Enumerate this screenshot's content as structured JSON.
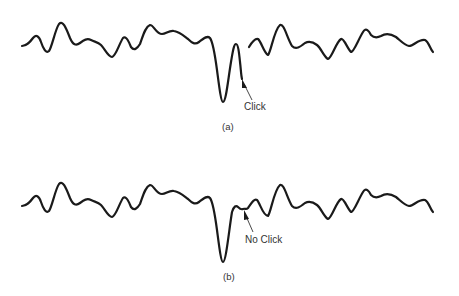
{
  "figure": {
    "panels": [
      {
        "id": "a",
        "caption": "(a)",
        "annotation": "Click",
        "description": "Waveform with a deep negative spike followed by a sharp rebound and a discontinuity (gap) in the trace"
      },
      {
        "id": "b",
        "caption": "(b)",
        "annotation": "No Click",
        "description": "Same waveform with deep negative spike but continuous trace after the rebound"
      }
    ],
    "colors": {
      "trace": "#1a1a1a",
      "text": "#333333",
      "background": "#ffffff"
    }
  }
}
